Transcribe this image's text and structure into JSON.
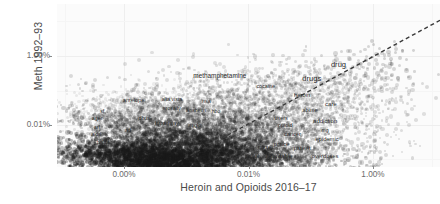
{
  "chart_data": {
    "type": "scatter",
    "title": "",
    "xlabel": "Heroin and Opioids 2016–17",
    "ylabel": "Meth 1992–93",
    "scale": "log-log",
    "grid": true,
    "legend": false,
    "xticks": [
      "0.00%",
      "0.01%",
      "1.00%"
    ],
    "yticks": [
      "1.00%",
      "0.01%"
    ],
    "xtick_positions": [
      0.175,
      0.5,
      0.825
    ],
    "ytick_positions": [
      0.32,
      0.745
    ],
    "reference_line": {
      "style": "dashed",
      "color": "#333333",
      "description": "y = x diagonal identity line",
      "x0": 0.3,
      "y0": 0.99,
      "x1": 1.0,
      "y1": 0.1
    },
    "point_style": {
      "color": "#1a1a1a",
      "opacity": 0.18,
      "description": "dense overplotted semi-transparent word-frequency points"
    },
    "annotations": [
      {
        "label": "drug",
        "x": 0.735,
        "y": 0.365,
        "size": 7.6
      },
      {
        "label": "drugs",
        "x": 0.665,
        "y": 0.455,
        "size": 7.6
      },
      {
        "label": "methamphetamine",
        "x": 0.425,
        "y": 0.435,
        "size": 6.4
      },
      {
        "label": "heroin",
        "x": 0.64,
        "y": 0.56,
        "size": 5.8
      },
      {
        "label": "cocaine",
        "x": 0.545,
        "y": 0.5,
        "size": 5.4
      },
      {
        "label": "care",
        "x": 0.715,
        "y": 0.612,
        "size": 6.0
      },
      {
        "label": "abuse",
        "x": 0.66,
        "y": 0.648,
        "size": 5.4
      },
      {
        "label": "addiction",
        "x": 0.7,
        "y": 0.72,
        "size": 6.0
      },
      {
        "label": "users",
        "x": 0.585,
        "y": 0.7,
        "size": 5.4
      },
      {
        "label": "opioid",
        "x": 0.596,
        "y": 0.74,
        "size": 5.4
      },
      {
        "label": "cancer",
        "x": 0.615,
        "y": 0.8,
        "size": 5.6
      },
      {
        "label": "epidemic",
        "x": 0.705,
        "y": 0.828,
        "size": 5.8
      },
      {
        "label": "prince",
        "x": 0.586,
        "y": 0.856,
        "size": 5.6
      },
      {
        "label": "patient",
        "x": 0.64,
        "y": 0.884,
        "size": 5.6
      },
      {
        "label": "nurse",
        "x": 0.542,
        "y": 0.88,
        "size": 5.2
      },
      {
        "label": "mg",
        "x": 0.7,
        "y": 0.77,
        "size": 5.0
      },
      {
        "label": "affordable",
        "x": 0.58,
        "y": 0.93,
        "size": 5.8
      },
      {
        "label": "overdoses",
        "x": 0.7,
        "y": 0.93,
        "size": 5.8
      },
      {
        "label": "social",
        "x": 0.51,
        "y": 0.93,
        "size": 5.2
      },
      {
        "label": "antelope",
        "x": 0.2,
        "y": 0.59,
        "size": 5.6
      },
      {
        "label": "alta vista",
        "x": 0.3,
        "y": 0.585,
        "size": 5.2
      },
      {
        "label": "nsa",
        "x": 0.39,
        "y": 0.595,
        "size": 5.2
      },
      {
        "label": "mosally",
        "x": 0.3,
        "y": 0.64,
        "size": 5.2
      },
      {
        "label": "anaheim",
        "x": 0.363,
        "y": 0.65,
        "size": 5.2
      },
      {
        "label": "hbo",
        "x": 0.415,
        "y": 0.655,
        "size": 5.0
      },
      {
        "label": "dbus",
        "x": 0.228,
        "y": 0.7,
        "size": 5.4
      },
      {
        "label": "broadway",
        "x": 0.287,
        "y": 0.73,
        "size": 5.4
      },
      {
        "label": "anglo",
        "x": 0.36,
        "y": 0.74,
        "size": 5.2
      },
      {
        "label": "sf",
        "x": 0.118,
        "y": 0.655,
        "size": 5.2
      },
      {
        "label": "ager",
        "x": 0.105,
        "y": 0.7,
        "size": 5.4
      },
      {
        "label": "arl",
        "x": 0.104,
        "y": 0.755,
        "size": 5.2
      },
      {
        "label": "aldri",
        "x": 0.102,
        "y": 0.8,
        "size": 5.2
      },
      {
        "label": "ballot",
        "x": 0.12,
        "y": 0.845,
        "size": 5.0
      },
      {
        "label": "ad",
        "x": 0.185,
        "y": 0.77,
        "size": 5.0
      }
    ]
  }
}
